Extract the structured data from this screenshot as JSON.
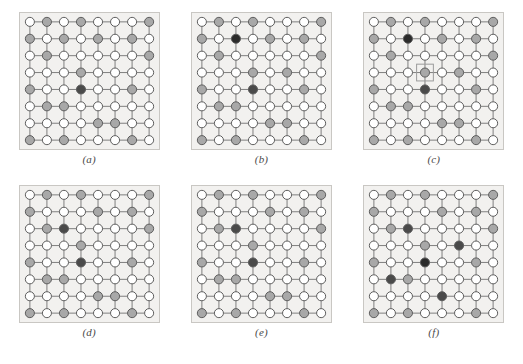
{
  "figure": {
    "kind": "lattice-panel-figure",
    "rows": 2,
    "cols": 3,
    "background_color": "#ffffff",
    "panel_background_color": "#f2f1ef",
    "panel_border_color": "#c9c7c3"
  },
  "legend": {
    "state_colors": {
      "empty": "#ffffff",
      "intermediate": "#a8a8a8",
      "active": "#4a4a4a",
      "strong": "#2b2b2b"
    },
    "node_stroke_color": "#5a5a5a",
    "edge_color": "#7d7d7d",
    "marker_color": "#9a9a9a"
  },
  "chart_data": {
    "type": "heatmap",
    "title": "",
    "xlabel": "",
    "ylabel": "",
    "grid_rows": 8,
    "grid_cols": 8,
    "state_levels": [
      "empty",
      "intermediate",
      "active",
      "strong"
    ],
    "panels": [
      {
        "id": "a",
        "label": "(a)",
        "marker": null,
        "cells": [
          [
            "empty",
            "intermediate",
            "empty",
            "intermediate",
            "empty",
            "empty",
            "empty",
            "intermediate"
          ],
          [
            "intermediate",
            "empty",
            "intermediate",
            "empty",
            "intermediate",
            "empty",
            "intermediate",
            "empty"
          ],
          [
            "empty",
            "intermediate",
            "empty",
            "empty",
            "empty",
            "empty",
            "empty",
            "intermediate"
          ],
          [
            "empty",
            "empty",
            "empty",
            "intermediate",
            "empty",
            "empty",
            "empty",
            "empty"
          ],
          [
            "intermediate",
            "empty",
            "empty",
            "active",
            "empty",
            "empty",
            "intermediate",
            "empty"
          ],
          [
            "empty",
            "intermediate",
            "intermediate",
            "empty",
            "empty",
            "empty",
            "empty",
            "empty"
          ],
          [
            "empty",
            "empty",
            "empty",
            "empty",
            "intermediate",
            "intermediate",
            "empty",
            "empty"
          ],
          [
            "intermediate",
            "empty",
            "intermediate",
            "empty",
            "empty",
            "empty",
            "intermediate",
            "empty"
          ]
        ]
      },
      {
        "id": "b",
        "label": "(b)",
        "marker": null,
        "cells": [
          [
            "empty",
            "intermediate",
            "empty",
            "intermediate",
            "empty",
            "empty",
            "empty",
            "intermediate"
          ],
          [
            "intermediate",
            "empty",
            "strong",
            "empty",
            "intermediate",
            "empty",
            "intermediate",
            "empty"
          ],
          [
            "empty",
            "intermediate",
            "empty",
            "empty",
            "empty",
            "empty",
            "empty",
            "intermediate"
          ],
          [
            "empty",
            "empty",
            "empty",
            "intermediate",
            "empty",
            "intermediate",
            "empty",
            "empty"
          ],
          [
            "intermediate",
            "empty",
            "empty",
            "active",
            "empty",
            "empty",
            "intermediate",
            "empty"
          ],
          [
            "empty",
            "intermediate",
            "intermediate",
            "empty",
            "empty",
            "empty",
            "empty",
            "empty"
          ],
          [
            "empty",
            "empty",
            "empty",
            "empty",
            "intermediate",
            "intermediate",
            "empty",
            "empty"
          ],
          [
            "intermediate",
            "empty",
            "intermediate",
            "empty",
            "empty",
            "empty",
            "intermediate",
            "empty"
          ]
        ]
      },
      {
        "id": "c",
        "label": "(c)",
        "marker": {
          "row": 3,
          "col": 3
        },
        "cells": [
          [
            "empty",
            "intermediate",
            "empty",
            "intermediate",
            "empty",
            "empty",
            "empty",
            "intermediate"
          ],
          [
            "intermediate",
            "empty",
            "strong",
            "empty",
            "intermediate",
            "empty",
            "intermediate",
            "empty"
          ],
          [
            "empty",
            "intermediate",
            "empty",
            "empty",
            "empty",
            "empty",
            "empty",
            "intermediate"
          ],
          [
            "empty",
            "empty",
            "empty",
            "intermediate",
            "empty",
            "intermediate",
            "empty",
            "empty"
          ],
          [
            "intermediate",
            "empty",
            "empty",
            "active",
            "empty",
            "empty",
            "intermediate",
            "empty"
          ],
          [
            "empty",
            "intermediate",
            "intermediate",
            "empty",
            "empty",
            "empty",
            "empty",
            "empty"
          ],
          [
            "empty",
            "empty",
            "empty",
            "empty",
            "intermediate",
            "intermediate",
            "empty",
            "empty"
          ],
          [
            "intermediate",
            "empty",
            "intermediate",
            "empty",
            "empty",
            "empty",
            "intermediate",
            "empty"
          ]
        ]
      },
      {
        "id": "d",
        "label": "(d)",
        "marker": null,
        "cells": [
          [
            "empty",
            "intermediate",
            "empty",
            "intermediate",
            "empty",
            "empty",
            "empty",
            "intermediate"
          ],
          [
            "intermediate",
            "empty",
            "empty",
            "empty",
            "intermediate",
            "empty",
            "intermediate",
            "empty"
          ],
          [
            "empty",
            "intermediate",
            "active",
            "empty",
            "empty",
            "empty",
            "empty",
            "intermediate"
          ],
          [
            "empty",
            "empty",
            "empty",
            "intermediate",
            "empty",
            "empty",
            "empty",
            "empty"
          ],
          [
            "intermediate",
            "empty",
            "empty",
            "active",
            "empty",
            "empty",
            "intermediate",
            "empty"
          ],
          [
            "empty",
            "intermediate",
            "intermediate",
            "empty",
            "empty",
            "empty",
            "empty",
            "empty"
          ],
          [
            "empty",
            "empty",
            "empty",
            "empty",
            "intermediate",
            "intermediate",
            "empty",
            "empty"
          ],
          [
            "intermediate",
            "empty",
            "intermediate",
            "empty",
            "empty",
            "empty",
            "intermediate",
            "empty"
          ]
        ]
      },
      {
        "id": "e",
        "label": "(e)",
        "marker": null,
        "cells": [
          [
            "empty",
            "intermediate",
            "empty",
            "intermediate",
            "empty",
            "empty",
            "empty",
            "intermediate"
          ],
          [
            "intermediate",
            "empty",
            "empty",
            "empty",
            "intermediate",
            "empty",
            "intermediate",
            "empty"
          ],
          [
            "empty",
            "intermediate",
            "active",
            "empty",
            "empty",
            "empty",
            "empty",
            "intermediate"
          ],
          [
            "empty",
            "empty",
            "empty",
            "intermediate",
            "empty",
            "empty",
            "empty",
            "empty"
          ],
          [
            "intermediate",
            "empty",
            "empty",
            "active",
            "empty",
            "empty",
            "intermediate",
            "empty"
          ],
          [
            "empty",
            "intermediate",
            "intermediate",
            "empty",
            "empty",
            "empty",
            "empty",
            "empty"
          ],
          [
            "empty",
            "empty",
            "empty",
            "empty",
            "intermediate",
            "intermediate",
            "empty",
            "empty"
          ],
          [
            "intermediate",
            "empty",
            "intermediate",
            "empty",
            "empty",
            "empty",
            "intermediate",
            "empty"
          ]
        ]
      },
      {
        "id": "f",
        "label": "(f)",
        "marker": null,
        "cells": [
          [
            "empty",
            "intermediate",
            "empty",
            "intermediate",
            "empty",
            "empty",
            "empty",
            "intermediate"
          ],
          [
            "intermediate",
            "empty",
            "empty",
            "empty",
            "intermediate",
            "empty",
            "intermediate",
            "empty"
          ],
          [
            "empty",
            "intermediate",
            "active",
            "empty",
            "empty",
            "empty",
            "empty",
            "intermediate"
          ],
          [
            "empty",
            "empty",
            "empty",
            "intermediate",
            "empty",
            "active",
            "empty",
            "empty"
          ],
          [
            "intermediate",
            "empty",
            "empty",
            "strong",
            "empty",
            "empty",
            "intermediate",
            "empty"
          ],
          [
            "empty",
            "active",
            "intermediate",
            "empty",
            "empty",
            "empty",
            "empty",
            "empty"
          ],
          [
            "empty",
            "empty",
            "empty",
            "empty",
            "active",
            "empty",
            "empty",
            "empty"
          ],
          [
            "intermediate",
            "empty",
            "intermediate",
            "empty",
            "empty",
            "empty",
            "intermediate",
            "empty"
          ]
        ]
      }
    ]
  }
}
